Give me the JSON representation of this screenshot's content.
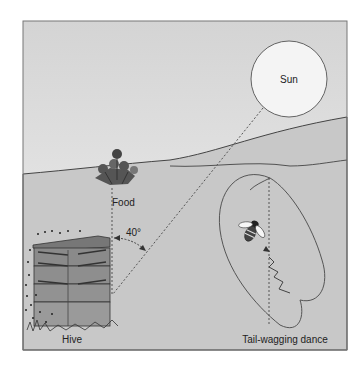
{
  "diagram": {
    "labels": {
      "sun": "Sun",
      "food": "Food",
      "hive": "Hive",
      "angle": "40°",
      "dance": "Tail-wagging dance"
    },
    "colors": {
      "sky_top": "#d6d6d6",
      "sky_bottom": "#f2f2f2",
      "ground": "#c9c9c9",
      "line": "#555555",
      "frame": "#777777"
    }
  }
}
